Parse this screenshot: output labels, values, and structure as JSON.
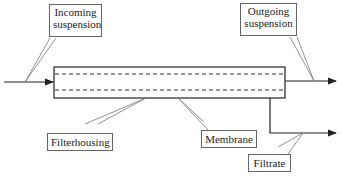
{
  "labels": {
    "incoming": "Incoming suspension",
    "incoming_l1": "Incoming",
    "incoming_l2": "suspension",
    "outgoing_l1": "Outgoing",
    "outgoing_l2": "suspension",
    "filterhousing": "Filterhousing",
    "membrane": "Membrane",
    "filtrate": "Filtrate"
  },
  "colors": {
    "line": "#222222",
    "callout": "#666666"
  }
}
